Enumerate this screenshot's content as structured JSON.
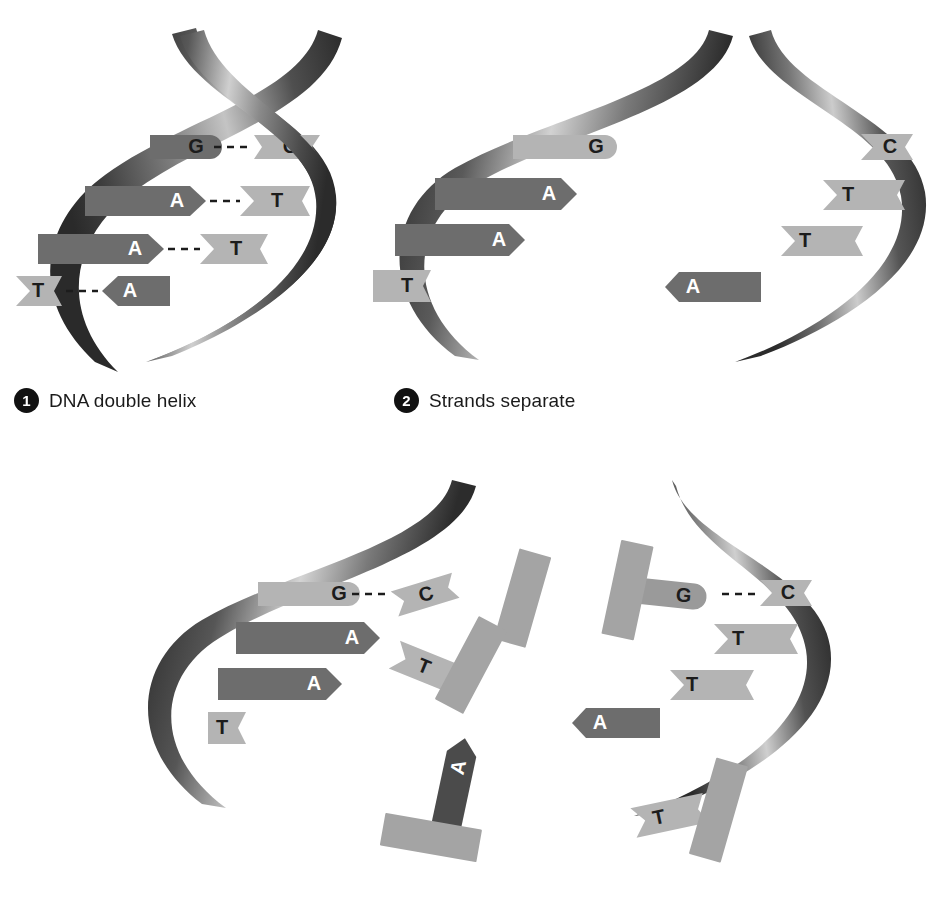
{
  "figure": {
    "type": "biology-process-diagram",
    "background": "#ffffff"
  },
  "palette": {
    "ribbon_dark": "#3a3a3a",
    "ribbon_mid": "#6e6e6e",
    "ribbon_light": "#c9c9c9",
    "base_dark": "#6d6d6d",
    "base_light": "#b4b4b4",
    "free_backbone": "#a4a4a4",
    "badge_fill": "#111111",
    "text_dark": "#1c1c1c",
    "text_light": "#ffffff",
    "hbond": "#1c1c1c"
  },
  "panels": [
    {
      "number": "1",
      "caption": "DNA double helix",
      "bases": [
        {
          "left": "G",
          "right": "C",
          "bonded": true
        },
        {
          "left": "A",
          "right": "T",
          "bonded": true
        },
        {
          "left": "A",
          "right": "T",
          "bonded": true
        },
        {
          "left": "T",
          "right": "A",
          "bonded": true
        }
      ]
    },
    {
      "number": "2",
      "caption": "Strands separate",
      "left_strand_bases": [
        "G",
        "A",
        "A",
        "T"
      ],
      "right_strand_bases": [
        "C",
        "T",
        "T",
        "A"
      ]
    },
    {
      "number": "3",
      "caption": "",
      "left_template_bases": [
        "G",
        "A",
        "A",
        "T"
      ],
      "left_incoming_bases": [
        "C",
        "T",
        "A"
      ],
      "right_template_bases": [
        "C",
        "T",
        "T",
        "A"
      ],
      "right_incoming_bases": [
        "G",
        "T"
      ]
    }
  ],
  "labels": {
    "panel1": {
      "row1_left": "G",
      "row1_right": "C",
      "row2_left": "A",
      "row2_right": "T",
      "row3_left": "A",
      "row3_right": "T",
      "row4_left": "T",
      "row4_right": "A"
    },
    "panel2": {
      "left_g": "G",
      "left_a1": "A",
      "left_a2": "A",
      "left_t": "T",
      "right_c": "C",
      "right_t1": "T",
      "right_t2": "T",
      "right_a": "A"
    },
    "panel3": {
      "left_g": "G",
      "left_a1": "A",
      "left_a2": "A",
      "left_t": "T",
      "left_free_c": "C",
      "left_free_t": "T",
      "left_free_a": "A",
      "right_c": "C",
      "right_t1": "T",
      "right_t2": "T",
      "right_a": "A",
      "right_free_g": "G",
      "right_free_t": "T"
    }
  }
}
